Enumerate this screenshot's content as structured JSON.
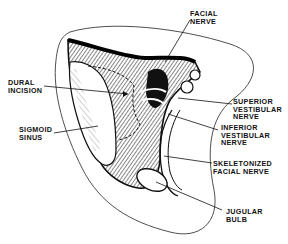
{
  "figure": {
    "type": "anatomical illustration",
    "colors": {
      "ink": "#111111",
      "background": "#ffffff"
    }
  },
  "labels": {
    "facial_nerve": {
      "line1": "FACIAL",
      "line2": "NERVE"
    },
    "dural_incision": {
      "line1": "DURAL",
      "line2": "INCISION"
    },
    "sigmoid_sinus": {
      "line1": "SIGMOID",
      "line2": "SINUS"
    },
    "superior_vestibular_nerve": {
      "line1": "SUPERIOR",
      "line2": "VESTIBULAR",
      "line3": "NERVE"
    },
    "inferior_vestibular_nerve": {
      "line1": "INFERIOR",
      "line2": "VESTIBULAR",
      "line3": "NERVE"
    },
    "skeletonized_facial_nerve": {
      "line1": "SKELETONIZED",
      "line2": "FACIAL NERVE"
    },
    "jugular_bulb": {
      "line1": "JUGULAR",
      "line2": "BULB"
    }
  }
}
